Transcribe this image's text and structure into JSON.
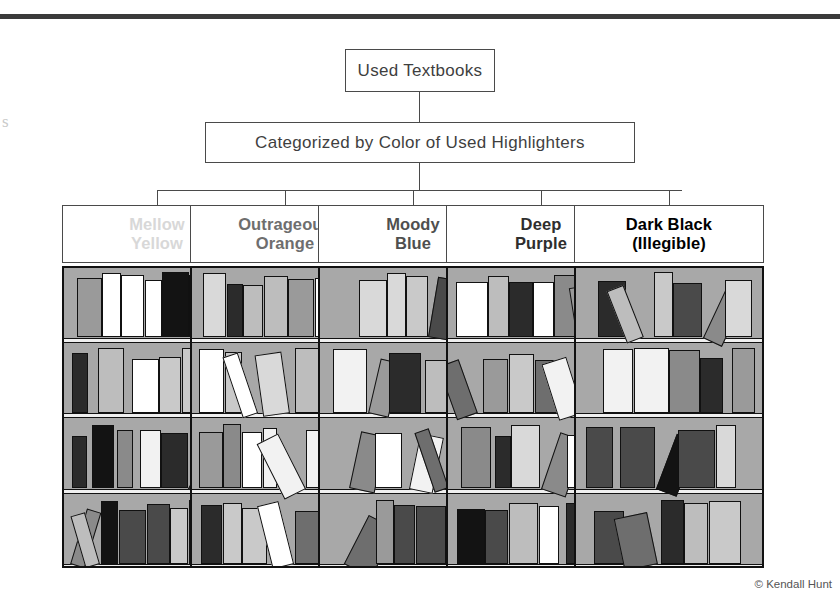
{
  "figure": {
    "credit": "© Kendall Hunt",
    "margin_fragment": "s",
    "root": {
      "label": "Used Textbooks"
    },
    "subtitle": {
      "label": "Categorized by Color of Used Highlighters"
    },
    "colors": {
      "rule": "#3b3b3b",
      "box_border": "#4a4a4a",
      "case_border": "#111111",
      "case_background": "#a8a8a8",
      "shelf_board": "#efefef",
      "page_background": "#ffffff"
    },
    "columns": [
      {
        "id": "mellow-yellow",
        "label": "Mellow\nYellow",
        "label_line1": "Mellow",
        "label_line2": "Yellow",
        "text_color": "#d8d8d8",
        "books": 33
      },
      {
        "id": "outrageous-orange",
        "label": "Outrageous\nOrange",
        "label_line1": "Outrageous",
        "label_line2": "Orange",
        "text_color": "#6e6e6e",
        "books": 31
      },
      {
        "id": "moody-blue",
        "label": "Moody\nBlue",
        "label_line1": "Moody",
        "label_line2": "Blue",
        "text_color": "#4f4f4f",
        "books": 22
      },
      {
        "id": "deep-purple",
        "label": "Deep\nPurple",
        "label_line1": "Deep",
        "label_line2": "Purple",
        "text_color": "#2e2e2e",
        "books": 27
      },
      {
        "id": "dark-black",
        "label": "Dark Black\n(Illegible)",
        "label_line1": "Dark Black",
        "label_line2": "(Illegible)",
        "text_color": "#000000",
        "books": 21
      }
    ]
  },
  "chart_data": {
    "type": "diagram",
    "title": "Used Textbooks",
    "subtitle": "Categorized by Color of Used Highlighters",
    "categories": [
      "Mellow Yellow",
      "Outrageous Orange",
      "Moody Blue",
      "Deep Purple",
      "Dark Black (Illegible)"
    ],
    "values": [
      33,
      31,
      22,
      27,
      21
    ],
    "xlabel": "",
    "ylabel": "Number of used textbooks (books shown on shelves)",
    "shelves_per_case": 4,
    "legend": "none",
    "grid": false,
    "note": "Each category is depicted as a bookcase of four shelves filled with books; header label tint darkens from left to right matching highlighter color darkness."
  },
  "geometry": {
    "columns_x": [
      62,
      190,
      318,
      446,
      574
    ],
    "column_width": 190,
    "case_top": 266,
    "case_bottom": 568,
    "header_top": 205,
    "header_height": 58,
    "bus_y": 190
  }
}
